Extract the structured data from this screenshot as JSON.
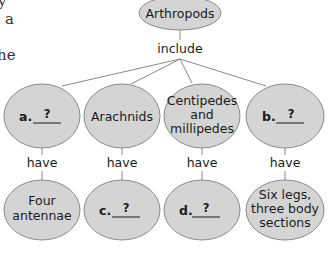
{
  "page_fragment": {
    "lines": [
      "y",
      "a",
      "",
      "he"
    ]
  },
  "colors": {
    "node_fill": "#d4d4d4",
    "node_stroke": "#8a8a8a",
    "line": "#8a8a8a",
    "text": "#1a1a1a"
  },
  "concept_map": {
    "root": {
      "label": "Arthropods"
    },
    "root_link": "include",
    "groups": [
      {
        "letter": "a.",
        "blank": "?",
        "link": "have",
        "feature": {
          "lines": [
            "Four",
            "antennae"
          ]
        }
      },
      {
        "label": "Arachnids",
        "link": "have",
        "feature": {
          "letter": "c.",
          "blank": "?"
        }
      },
      {
        "label_lines": [
          "Centipedes",
          "and",
          "millipedes"
        ],
        "link": "have",
        "feature": {
          "letter": "d.",
          "blank": "?"
        }
      },
      {
        "letter": "b.",
        "blank": "?",
        "link": "have",
        "feature": {
          "lines": [
            "Six legs,",
            "three body",
            "sections"
          ]
        }
      }
    ]
  }
}
